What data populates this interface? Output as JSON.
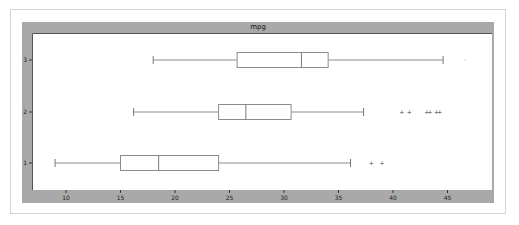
{
  "chart_data": {
    "type": "boxplot",
    "orientation": "horizontal",
    "title": "mpg",
    "xlabel": "",
    "ylabel": "",
    "categories": [
      "1",
      "2",
      "3"
    ],
    "x_ticks": [
      10,
      15,
      20,
      25,
      30,
      35,
      40,
      45
    ],
    "xlim": [
      7.5,
      48.5
    ],
    "grid": false,
    "legend": null,
    "series": [
      {
        "name": "1",
        "whisker_low": 9.0,
        "q1": 15.0,
        "median": 18.5,
        "q3": 24.0,
        "whisker_high": 36.1,
        "outliers": [
          38.0,
          39.0
        ]
      },
      {
        "name": "2",
        "whisker_low": 16.2,
        "q1": 24.0,
        "median": 26.5,
        "q3": 30.65,
        "whisker_high": 37.3,
        "outliers": [
          40.8,
          41.5,
          43.1,
          43.4,
          44.0,
          44.3
        ]
      },
      {
        "name": "3",
        "whisker_low": 18.0,
        "q1": 25.7,
        "median": 31.6,
        "q3": 34.05,
        "whisker_high": 44.6,
        "outliers": [
          46.6
        ]
      }
    ],
    "colors": {
      "panel": "#a9a9a9",
      "plot_bg": "#ffffff",
      "box_stroke": "#8c8c8c",
      "outlier": "#444444"
    }
  }
}
